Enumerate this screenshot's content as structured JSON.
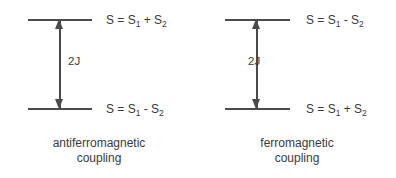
{
  "diagram": {
    "type": "energy-level-diagram",
    "background_color": "#ffffff",
    "stroke_color": "#4a4a4a",
    "text_color": "#3a3a3a",
    "panels": [
      {
        "id": "antiferromagnetic",
        "caption_line1": "antiferromagnetic",
        "caption_line2": "coupling",
        "coupling_label": "2J",
        "upper_level": {
          "prefix": "S = S",
          "sub1": "1",
          "operator": " + S",
          "sub2": "2"
        },
        "lower_level": {
          "prefix": "S = S",
          "sub1": "1",
          "operator": " - S",
          "sub2": "2"
        }
      },
      {
        "id": "ferromagnetic",
        "caption_line1": "ferromagnetic",
        "caption_line2": "coupling",
        "coupling_label": "2J",
        "upper_level": {
          "prefix": "S = S",
          "sub1": "1",
          "operator": " - S",
          "sub2": "2"
        },
        "lower_level": {
          "prefix": "S = S",
          "sub1": "1",
          "operator": " + S",
          "sub2": "2"
        }
      }
    ]
  }
}
